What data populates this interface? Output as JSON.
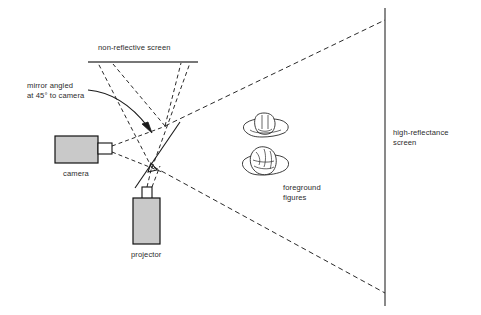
{
  "diagram": {
    "background_color": "#ffffff",
    "line_color": "#1a1a1a",
    "device_fill_color": "#c9c9c9",
    "labels": {
      "non_reflective_screen": "non-reflective screen",
      "mirror_note_line1": "mirror angled",
      "mirror_note_line2": "at 45° to camera",
      "camera": "camera",
      "projector": "projector",
      "foreground_line1": "foreground",
      "foreground_line2": "figures",
      "high_reflectance_line1": "high-reflectance",
      "high_reflectance_line2": "screen"
    },
    "elements": {
      "camera_name": "camera",
      "projector_name": "projector",
      "mirror_name": "45-degree mirror",
      "non_reflective_screen_name": "non-reflective screen",
      "high_reflectance_screen_name": "high-reflectance screen",
      "foreground_figures_count": 2
    },
    "geometry": {
      "mirror_angle_degrees": 45,
      "high_reflectance_screen_x": 385,
      "non_reflective_screen_y": 62,
      "non_reflective_screen_x_start": 88,
      "non_reflective_screen_x_end": 198
    }
  }
}
